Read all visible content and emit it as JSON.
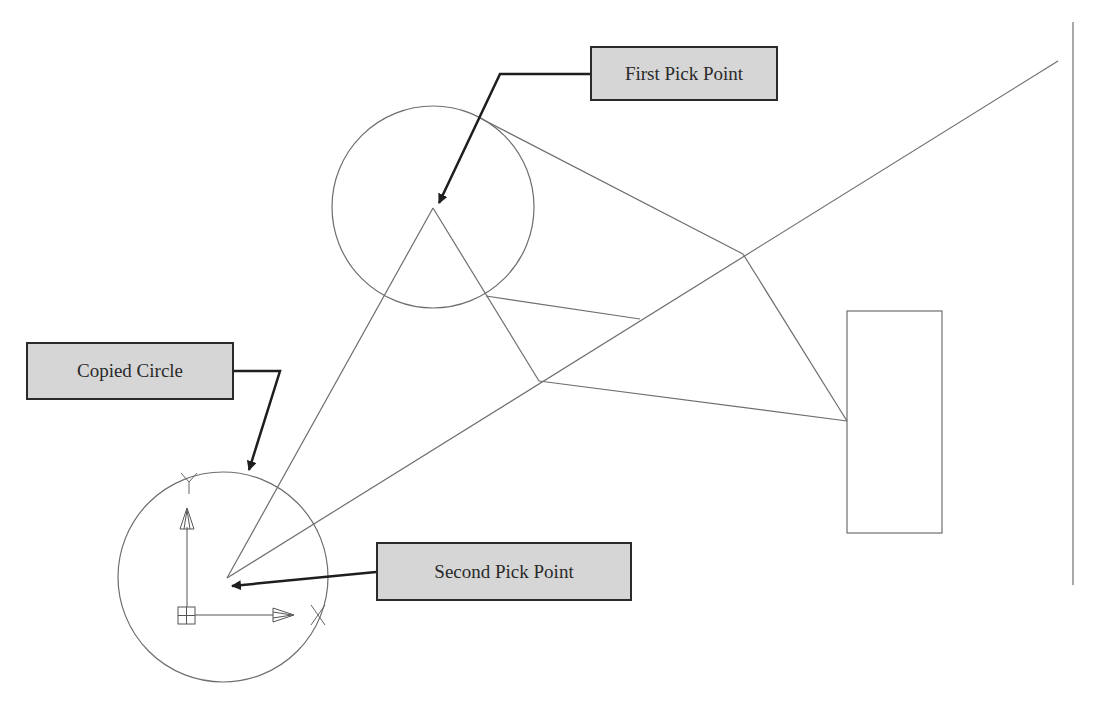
{
  "diagram": {
    "type": "cad-copy-command-illustration",
    "colors": {
      "background": "#ffffff",
      "geometry_stroke": "#6e6e6e",
      "leader_stroke": "#1e1e1e",
      "label_fill": "#d6d6d6",
      "label_border": "#2a2a2a",
      "label_text": "#2a2a2a"
    },
    "labels": {
      "first_pick_point": "First Pick Point",
      "copied_circle": "Copied Circle",
      "second_pick_point": "Second Pick Point"
    },
    "icons": {
      "ucs": "ucs-axis-icon",
      "x_mark": "x-axis-mark-icon",
      "y_mark": "y-axis-mark-icon"
    }
  }
}
